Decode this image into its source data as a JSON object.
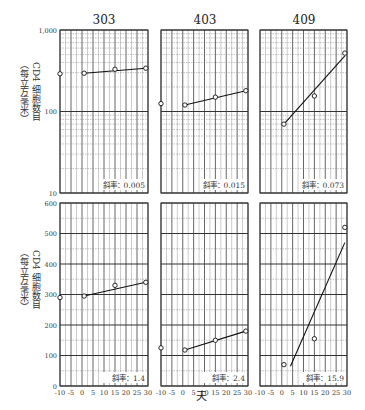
{
  "figure": {
    "ylabel_line1": "CD4 细胞数目",
    "ylabel_line2": "（每立方毫米）",
    "xlabel": "天"
  },
  "chart_data": [
    {
      "type": "scatter",
      "title": "303",
      "row": "top",
      "yscale": "log",
      "ylim": [
        10,
        1000
      ],
      "yticks": [
        "10",
        "100",
        "1,000"
      ],
      "xlim": [
        -10,
        30
      ],
      "xlabel": "天",
      "ylabel": "CD4 细胞数目（每立方毫米）",
      "points": [
        {
          "x": -10,
          "y": 290
        },
        {
          "x": 1,
          "y": 295
        },
        {
          "x": 15,
          "y": 330
        },
        {
          "x": 29,
          "y": 340
        }
      ],
      "fit": {
        "x": [
          1,
          29
        ],
        "y": [
          295,
          340
        ]
      },
      "annotation": "斜率：0.005",
      "grid": true
    },
    {
      "type": "scatter",
      "title": "403",
      "row": "top",
      "yscale": "log",
      "ylim": [
        10,
        1000
      ],
      "xlim": [
        -10,
        30
      ],
      "points": [
        {
          "x": -10,
          "y": 125
        },
        {
          "x": 1,
          "y": 120
        },
        {
          "x": 15,
          "y": 150
        },
        {
          "x": 29,
          "y": 180
        }
      ],
      "fit": {
        "x": [
          1,
          29
        ],
        "y": [
          120,
          180
        ]
      },
      "annotation": "斜率：0.015",
      "grid": true
    },
    {
      "type": "scatter",
      "title": "409",
      "row": "top",
      "yscale": "log",
      "ylim": [
        10,
        1000
      ],
      "xlim": [
        -10,
        30
      ],
      "points": [
        {
          "x": 1,
          "y": 70
        },
        {
          "x": 15,
          "y": 155
        },
        {
          "x": 29,
          "y": 520
        }
      ],
      "fit": {
        "x": [
          1,
          29
        ],
        "y": [
          70,
          480
        ]
      },
      "annotation": "斜率：0.073",
      "grid": true
    },
    {
      "type": "scatter",
      "title": "303",
      "row": "bottom",
      "yscale": "linear",
      "ylim": [
        0,
        600
      ],
      "yticks": [
        "0",
        "100",
        "200",
        "300",
        "400",
        "500",
        "600"
      ],
      "xlim": [
        -10,
        30
      ],
      "xticks": [
        "-10",
        "-5",
        "0",
        "5",
        "10",
        "15",
        "20",
        "25",
        "30"
      ],
      "points": [
        {
          "x": -10,
          "y": 290
        },
        {
          "x": 1,
          "y": 295
        },
        {
          "x": 15,
          "y": 330
        },
        {
          "x": 29,
          "y": 340
        }
      ],
      "fit": {
        "x": [
          1,
          29
        ],
        "y": [
          295,
          340
        ]
      },
      "annotation": "斜率：1.4",
      "grid": true
    },
    {
      "type": "scatter",
      "title": "403",
      "row": "bottom",
      "yscale": "linear",
      "ylim": [
        0,
        600
      ],
      "xlim": [
        -10,
        30
      ],
      "xticks": [
        "-10",
        "-5",
        "0",
        "5",
        "10",
        "15",
        "20",
        "25",
        "30"
      ],
      "points": [
        {
          "x": -10,
          "y": 125
        },
        {
          "x": 1,
          "y": 118
        },
        {
          "x": 15,
          "y": 150
        },
        {
          "x": 29,
          "y": 180
        }
      ],
      "fit": {
        "x": [
          1,
          29
        ],
        "y": [
          118,
          180
        ]
      },
      "annotation": "斜率：2.4",
      "grid": true
    },
    {
      "type": "scatter",
      "title": "409",
      "row": "bottom",
      "yscale": "linear",
      "ylim": [
        0,
        600
      ],
      "xlim": [
        -10,
        30
      ],
      "xticks": [
        "-10",
        "-5",
        "0",
        "5",
        "10",
        "15",
        "20",
        "25",
        "30"
      ],
      "points": [
        {
          "x": 1,
          "y": 70
        },
        {
          "x": 15,
          "y": 155
        },
        {
          "x": 29,
          "y": 520
        }
      ],
      "fit": {
        "x": [
          4,
          29
        ],
        "y": [
          65,
          470
        ]
      },
      "annotation": "斜率：15.9",
      "grid": true
    }
  ]
}
